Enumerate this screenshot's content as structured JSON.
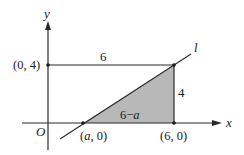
{
  "diagram": {
    "axes": {
      "x_label": "x",
      "y_label": "y",
      "origin_label": "O"
    },
    "line_label": "l",
    "points": {
      "p04": "(0, 4)",
      "a0_open": "(",
      "a0_var": "a",
      "a0_close": ", 0)",
      "p60": "(6, 0)"
    },
    "segment_labels": {
      "top": "6",
      "right": "4",
      "base_num": "6−",
      "base_var": "a"
    },
    "colors": {
      "shade": "#b8b8b8",
      "line": "#2a2a2a"
    }
  }
}
